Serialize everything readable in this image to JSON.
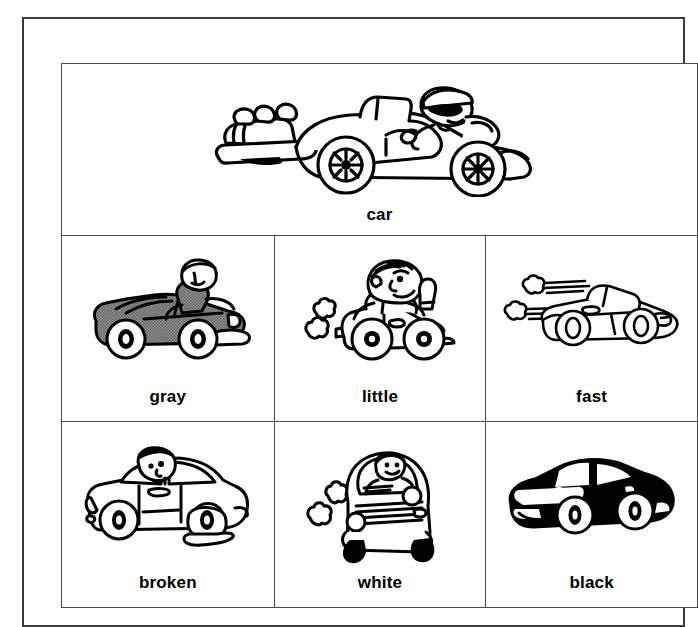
{
  "worksheet": {
    "headword": {
      "label": "car",
      "illustration": "classic-roadster-convertible-with-driver-in-cap-and-sunglasses"
    },
    "rows": [
      {
        "cells": [
          {
            "label": "gray",
            "illustration": "gray-shaded-convertible-with-driver",
            "fill": "#808080"
          },
          {
            "label": "little",
            "illustration": "small-car-with-large-driver-exhaust-puffs",
            "fill": "#ffffff"
          },
          {
            "label": "fast",
            "illustration": "sports-car-with-speed-lines-and-puffs",
            "fill": "#ffffff"
          }
        ]
      },
      {
        "cells": [
          {
            "label": "broken",
            "illustration": "car-with-flat-tire-and-puddle",
            "fill": "#ffffff"
          },
          {
            "label": "white",
            "illustration": "front-view-white-car-with-driver-and-puffs",
            "fill": "#ffffff"
          },
          {
            "label": "black",
            "illustration": "solid-black-filled-sedan",
            "fill": "#000000"
          }
        ]
      }
    ],
    "colors": {
      "ink": "#000000",
      "frame": "#3a3a3a",
      "grid_line": "#4a4a4a",
      "paper": "#ffffff",
      "gray_tone": "#808080"
    }
  }
}
